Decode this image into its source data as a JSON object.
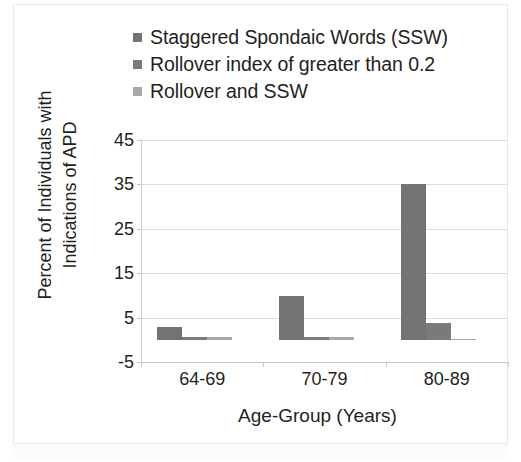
{
  "chart_data": {
    "type": "bar",
    "title": "",
    "xlabel": "Age-Group (Years)",
    "ylabel": "Percent of Individuals with Indications of APD",
    "ylabel_line1": "Percent of Individuals with",
    "ylabel_line2": "Indications of APD",
    "categories": [
      "64-69",
      "70-79",
      "80-89"
    ],
    "yticks": [
      -5,
      5,
      15,
      25,
      35,
      45
    ],
    "ytick_labels": [
      "-5",
      "5",
      "15",
      "25",
      "35",
      "45"
    ],
    "ylim": [
      -5,
      45
    ],
    "grid": true,
    "legend_position": "top-left",
    "series": [
      {
        "name": "Staggered Spondaic Words (SSW)",
        "color": "#737373",
        "values": [
          3.0,
          10.0,
          35.1
        ]
      },
      {
        "name": "Rollover index of greater than 0.2",
        "color": "#7a7a7a",
        "values": [
          0.6,
          0.6,
          3.8
        ]
      },
      {
        "name": "Rollover and SSW",
        "color": "#a8a8a8",
        "values": [
          0.6,
          0.6,
          0.2
        ]
      }
    ]
  },
  "figure": {
    "background": "#ffffff",
    "text_color": "#231f20",
    "grid_color": "#dcdcdc",
    "axis_color": "#c9c9c9"
  }
}
